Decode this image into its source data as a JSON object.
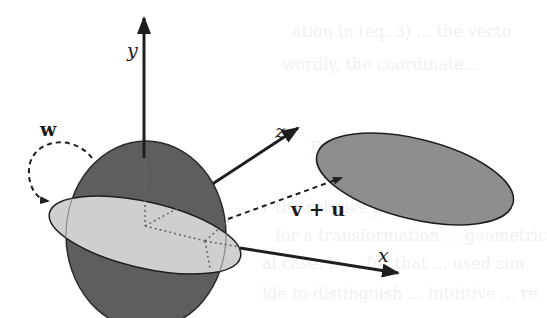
{
  "figure": {
    "axes": {
      "y_label": "y",
      "z_label": "z",
      "x_label": "x"
    },
    "labels": {
      "rotation": "w",
      "translation": "v + u"
    },
    "colors": {
      "sphere": "#5e5e5e",
      "disk": "#cfcfcf",
      "target_ellipse": "#8e8e8e",
      "stroke": "#1e1e1e",
      "background": "#ffffff"
    }
  },
  "background_text": {
    "line1": "ation in (eq. 3) ... the vecto",
    "line2": "wordly, the coordinate...",
    "line3": "Decomposition",
    "line4": "r the relative position ... we",
    "line5": "for a transformation ... geometric",
    "line6": "al case. It ... for that ... used sim",
    "line7": "lde to distinguish ... intuitive ... re"
  }
}
